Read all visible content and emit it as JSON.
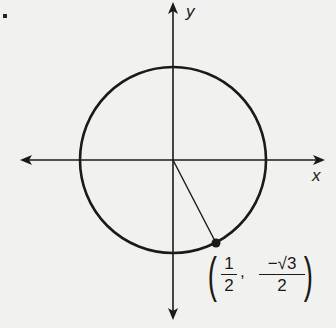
{
  "diagram": {
    "axes": {
      "x_label": "x",
      "y_label": "y"
    },
    "circle": {
      "center": [
        0,
        0
      ],
      "radius": 1
    },
    "point": {
      "x_num": "1",
      "x_den": "2",
      "y_num": "−√3",
      "y_den": "2",
      "comma": ","
    },
    "colors": {
      "stroke": "#1a1a1a",
      "background": "#f1f1ef"
    }
  }
}
